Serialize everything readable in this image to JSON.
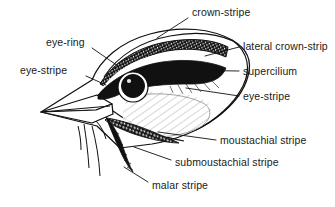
{
  "diagram": {
    "ink_color": "#111111",
    "background_color": "#ffffff",
    "labels": [
      {
        "id": "crown-stripe",
        "text": "crown-stripe",
        "x": 192,
        "y": 7,
        "leader": {
          "from": [
            188,
            18
          ],
          "to": [
            157,
            38
          ]
        }
      },
      {
        "id": "lateral-crown-stripe",
        "text": "lateral crown-strip",
        "x": 243,
        "y": 41,
        "truncated": true,
        "leader": {
          "from": [
            239,
            47
          ],
          "to": [
            205,
            56
          ]
        }
      },
      {
        "id": "supercilium",
        "text": "supercilium",
        "x": 243,
        "y": 66,
        "leader": {
          "from": [
            239,
            71
          ],
          "to": [
            172,
            70
          ]
        }
      },
      {
        "id": "eye-stripe-right",
        "text": "eye-stripe",
        "x": 243,
        "y": 91,
        "leader": {
          "from": [
            239,
            96
          ],
          "to": [
            186,
            88
          ]
        }
      },
      {
        "id": "eye-ring",
        "text": "eye-ring",
        "x": 46,
        "y": 37,
        "leader": {
          "from": [
            92,
            48
          ],
          "to": [
            118,
            66
          ]
        }
      },
      {
        "id": "eye-stripe-left",
        "text": "eye-stripe",
        "x": 20,
        "y": 65,
        "leader": {
          "from": [
            86,
            76
          ],
          "to": [
            104,
            84
          ]
        }
      },
      {
        "id": "moustachial-stripe",
        "text": "moustachial stripe",
        "x": 220,
        "y": 135,
        "leader": {
          "from": [
            216,
            140
          ],
          "to": [
            158,
            132
          ]
        }
      },
      {
        "id": "submoustachial-stripe",
        "text": "submoustachial stripe",
        "x": 175,
        "y": 157,
        "leader": {
          "from": [
            171,
            160
          ],
          "to": [
            134,
            147
          ]
        }
      },
      {
        "id": "malar-stripe",
        "text": "malar stripe",
        "x": 152,
        "y": 180,
        "leader": {
          "from": [
            148,
            182
          ],
          "to": [
            124,
            167
          ]
        }
      }
    ],
    "features": [
      {
        "id": "beak",
        "name": "pointed bill pointing left"
      },
      {
        "id": "eye",
        "name": "black eye with pale eye-ring"
      },
      {
        "id": "crown",
        "name": "hatched crown stripes"
      },
      {
        "id": "nape",
        "name": "rounded nape outline"
      },
      {
        "id": "throat",
        "name": "throat and chin lines"
      }
    ]
  }
}
